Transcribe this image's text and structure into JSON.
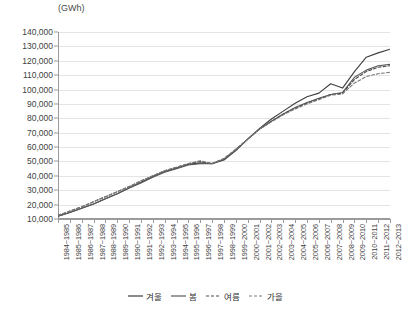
{
  "chart_data": {
    "type": "line",
    "title": "",
    "subtitle": "",
    "xlabel": "",
    "ylabel": "(GWh)",
    "unit_label": "(GWh)",
    "ylim": [
      10000,
      140000
    ],
    "ytick_step": 10000,
    "ytick_labels": [
      "140,000",
      "130,000",
      "120,000",
      "110,000",
      "100,000",
      "90,000",
      "80,000",
      "70,000",
      "60,000",
      "50,000",
      "40,000",
      "30,000",
      "20,000",
      "10,000"
    ],
    "ytick_values": [
      140000,
      130000,
      120000,
      110000,
      100000,
      90000,
      80000,
      70000,
      60000,
      50000,
      40000,
      30000,
      20000,
      10000
    ],
    "grid": true,
    "grid_axis": "y",
    "legend_position": "bottom",
    "categories": [
      "1984~1985",
      "1985~1986",
      "1986~1987",
      "1987~1988",
      "1988~1989",
      "1989~1990",
      "1990~1991",
      "1991~1992",
      "1992~1993",
      "1993~1994",
      "1994~1995",
      "1995~1996",
      "1996~1997",
      "1997~1998",
      "1998~1999",
      "1999~2000",
      "2000~2001",
      "2001~2002",
      "2002~2003",
      "2003~2004",
      "2004~2005",
      "2005~2006",
      "2006~2007",
      "2007~2008",
      "2008~2009",
      "2009~2010",
      "2010~2011",
      "2011~2012",
      "2012~2013"
    ],
    "series": [
      {
        "name": "겨울",
        "style": "solid",
        "color": "#3d3d3d",
        "values": [
          12000,
          14500,
          17500,
          20500,
          24000,
          27500,
          31500,
          35500,
          39500,
          43000,
          45500,
          48000,
          49000,
          48500,
          51000,
          57500,
          65500,
          73000,
          79500,
          85000,
          90500,
          95000,
          97500,
          104000,
          101000,
          112500,
          122500,
          125500,
          128000
        ]
      },
      {
        "name": "봄",
        "style": "solid",
        "color": "#5a5a5a",
        "values": [
          12000,
          14500,
          17500,
          20500,
          24000,
          27500,
          31500,
          35000,
          39000,
          42500,
          45000,
          47500,
          48500,
          48500,
          51500,
          58000,
          65500,
          72500,
          78000,
          83000,
          87500,
          91000,
          94000,
          96500,
          98000,
          108500,
          113500,
          116500,
          117500
        ]
      },
      {
        "name": "여름",
        "style": "dashed",
        "color": "#4a4a4a",
        "values": [
          12500,
          15500,
          18500,
          22000,
          25500,
          29000,
          32500,
          36500,
          40000,
          43500,
          46000,
          48500,
          50000,
          48500,
          52000,
          58500,
          65500,
          72500,
          78000,
          83000,
          87000,
          90500,
          93500,
          96500,
          97500,
          107000,
          112500,
          115500,
          116500
        ]
      },
      {
        "name": "가을",
        "style": "dashed",
        "color": "#7a7a7a",
        "values": [
          12500,
          15500,
          18500,
          22000,
          25500,
          29000,
          32500,
          36500,
          40000,
          43500,
          46000,
          48500,
          50500,
          48500,
          52000,
          58500,
          65500,
          72500,
          77500,
          82500,
          86500,
          90000,
          93000,
          96000,
          97000,
          104500,
          109000,
          111000,
          112000
        ]
      }
    ]
  },
  "legend": {
    "items": [
      {
        "label": "겨울",
        "style": "solid"
      },
      {
        "label": "봄",
        "style": "solid"
      },
      {
        "label": "여름",
        "style": "dashed"
      },
      {
        "label": "가을",
        "style": "dashed"
      }
    ]
  }
}
